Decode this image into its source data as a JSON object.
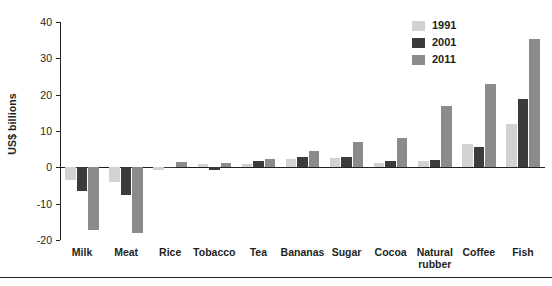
{
  "chart_data": {
    "type": "bar",
    "title": "",
    "subtitle": "",
    "xlabel": "",
    "ylabel": "US$ billions",
    "ylim": [
      -20,
      40
    ],
    "yticks": [
      40,
      30,
      20,
      10,
      0,
      -10,
      -20
    ],
    "ytick_labels": [
      "40",
      "30",
      "20",
      "10",
      "0",
      "-10",
      "-20"
    ],
    "grid": false,
    "legend_position": "top-right",
    "categories": [
      "Milk",
      "Meat",
      "Rice",
      "Tobacco",
      "Tea",
      "Bananas",
      "Sugar",
      "Cocoa",
      "Natural rubber",
      "Coffee",
      "Fish"
    ],
    "series": [
      {
        "name": "1991",
        "color": "#d2d2d2",
        "values": [
          -3.5,
          -4.0,
          -0.6,
          0.9,
          0.8,
          2.2,
          2.5,
          1.3,
          1.8,
          6.4,
          12.0
        ]
      },
      {
        "name": "2001",
        "color": "#3b3b3b",
        "values": [
          -6.5,
          -7.5,
          0.1,
          -0.7,
          1.7,
          2.8,
          2.9,
          1.7,
          2.0,
          5.6,
          18.8
        ]
      },
      {
        "name": "2011",
        "color": "#8b8b8b",
        "values": [
          -17.2,
          -18.0,
          1.5,
          1.3,
          2.3,
          4.4,
          7.0,
          8.0,
          17.0,
          23.0,
          35.2
        ]
      }
    ]
  },
  "legend": {
    "entries": [
      {
        "label": "1991",
        "color": "#d2d2d2"
      },
      {
        "label": "2001",
        "color": "#3b3b3b"
      },
      {
        "label": "2011",
        "color": "#8b8b8b"
      }
    ]
  }
}
